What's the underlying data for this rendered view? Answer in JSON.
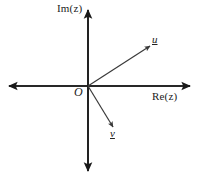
{
  "figure": {
    "kind": "argand-diagram",
    "background_color": "#ffffff",
    "stroke_color": "#1a1a1a",
    "canvas": {
      "width": 207,
      "height": 177
    }
  },
  "axes": {
    "origin_label": "O",
    "imaginary": {
      "label": "Im(z)",
      "orientation": "vertical",
      "arrow_top": true,
      "arrow_bottom": true,
      "x": 88,
      "y_top": 10,
      "y_bottom": 171
    },
    "real": {
      "label": "Re(z)",
      "orientation": "horizontal",
      "arrow_left": true,
      "arrow_right": true,
      "y": 86,
      "x_left": 9,
      "x_right": 190
    }
  },
  "vectors": [
    {
      "name": "u",
      "label": "u",
      "underlined": true,
      "start": {
        "x": 88,
        "y": 86
      },
      "end": {
        "x": 150,
        "y": 46
      },
      "direction": "upper-right",
      "quadrant": 1
    },
    {
      "name": "v",
      "label": "v",
      "underlined": true,
      "start": {
        "x": 88,
        "y": 86
      },
      "end": {
        "x": 113,
        "y": 127
      },
      "direction": "lower-right",
      "quadrant": 4
    }
  ]
}
